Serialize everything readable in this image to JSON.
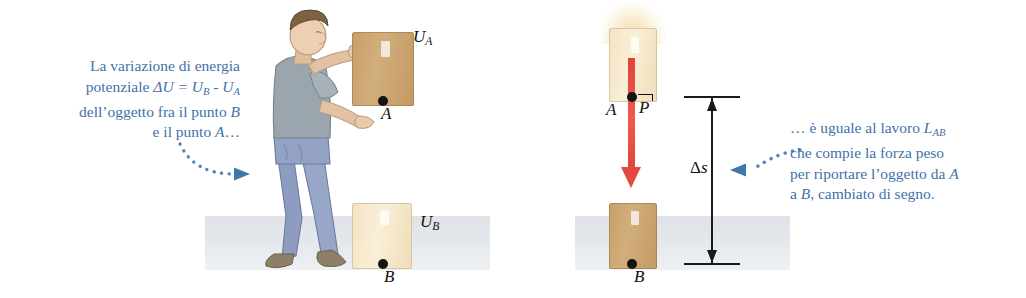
{
  "figure": {
    "colors": {
      "annotation_blue": "#3f72a8",
      "connector_blue": "#4e86bd",
      "force_red": "#e24a3d",
      "box_dark": "#c9a26b",
      "box_pale": "#f5e6c8",
      "ground_gray": "#e2e6ea",
      "label_black": "#111111"
    }
  },
  "annotations": {
    "left": {
      "lines": [
        {
          "pre": "La variazione di energia",
          "mid": "",
          "post": ""
        },
        {
          "pre": "potenziale ",
          "math": "ΔU = U",
          "sub1": "B",
          "mid": " - ",
          "math2": "U",
          "sub2": "A"
        },
        {
          "pre": "dell’oggetto fra il punto ",
          "italic": "B"
        },
        {
          "pre": "e il punto ",
          "italic": "A",
          "post": "…"
        }
      ],
      "plain": "La variazione di energia potenziale ΔU = UB - UA dell’oggetto fra il punto B e il punto A…"
    },
    "right": {
      "lines": [
        {
          "pre": "… è uguale al lavoro ",
          "math": "L",
          "sub1": "AB"
        },
        {
          "pre": "che compie la forza peso"
        },
        {
          "pre": "per riportare l’oggetto da ",
          "italic": "A"
        },
        {
          "pre": "a ",
          "italic": "B",
          "post": ", cambiato di segno."
        }
      ],
      "plain": "… è uguale al lavoro LAB che compie la forza peso per riportare l’oggetto da A a B, cambiato di segno."
    }
  },
  "labels": {
    "U_A": {
      "base": "U",
      "sub": "A"
    },
    "U_B": {
      "base": "U",
      "sub": "B"
    },
    "point_A_left": "A",
    "point_B_left": "B",
    "point_A_right": "A",
    "point_B_right": "B",
    "force_P": "P",
    "delta_s": {
      "delta": "Δ",
      "sym": "s"
    }
  },
  "scene": {
    "left_panel": {
      "person": "man-lowering-box",
      "held_box_label": "U_A",
      "ground_box_label": "U_B"
    },
    "right_panel": {
      "upper_box": "box-at-point-A",
      "lower_box": "box-at-point-B",
      "force_vector": "weight-force-P-downward",
      "dimension": "delta-s-height"
    }
  }
}
